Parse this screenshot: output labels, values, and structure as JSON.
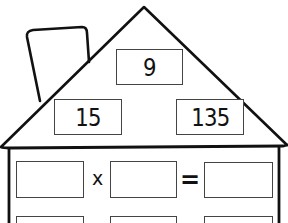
{
  "worksheet": {
    "title": "Fact Family House",
    "roof": {
      "top_number": "9",
      "left_number": "15",
      "right_number": "135"
    },
    "equations": [
      {
        "operand1": "",
        "operator": "x",
        "operand2": "",
        "equals": "=",
        "result": ""
      },
      {
        "operand1": "",
        "operator": "",
        "operand2": "",
        "equals": "",
        "result": ""
      }
    ]
  },
  "colors": {
    "line": "#111111",
    "box_border": "#444444",
    "background": "#ffffff"
  }
}
